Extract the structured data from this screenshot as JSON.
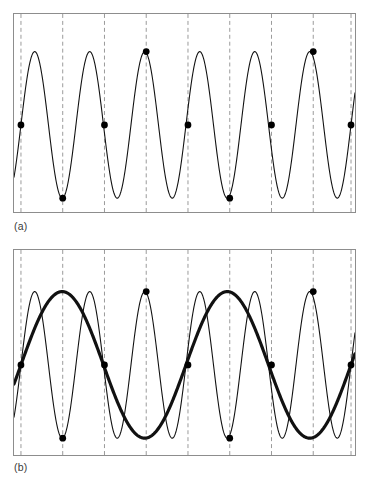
{
  "figure": {
    "background_color": "#ffffff",
    "frame_color": "#8d8d8d",
    "curve_color": "#111111",
    "sample_marker_color": "#000000",
    "dashed_line_color": "#9a9a9a"
  },
  "panels": [
    {
      "id": "a",
      "label": "(a)",
      "caption": "Original high-frequency sine wave with sample points",
      "frame": {
        "x": 13,
        "y": 13,
        "width": 343,
        "height": 200
      },
      "curves": [
        {
          "name": "original-signal",
          "style": "thin",
          "stroke_width": 1.1,
          "cycles": 6.0,
          "phase_deg": 0,
          "amplitude_px": 74,
          "baseline_y_px": 112
        }
      ],
      "sample_lines_x": [
        20,
        62,
        104,
        146,
        188,
        230,
        272,
        314,
        352
      ],
      "sample_points": [
        {
          "x": 20,
          "y": 112,
          "level": "mid-rising"
        },
        {
          "x": 62,
          "y": 186,
          "level": "trough"
        },
        {
          "x": 104,
          "y": 112,
          "level": "mid-rising"
        },
        {
          "x": 146,
          "y": 38,
          "level": "peak"
        },
        {
          "x": 188,
          "y": 112,
          "level": "mid-falling"
        },
        {
          "x": 230,
          "y": 186,
          "level": "trough"
        },
        {
          "x": 272,
          "y": 112,
          "level": "mid-rising"
        },
        {
          "x": 314,
          "y": 38,
          "level": "peak"
        },
        {
          "x": 352,
          "y": 112,
          "level": "mid-falling"
        }
      ]
    },
    {
      "id": "b",
      "label": "(b)",
      "caption": "Same samples reconstructed as a lower-frequency alias wave",
      "frame": {
        "x": 13,
        "y": 249,
        "width": 343,
        "height": 207
      },
      "curves": [
        {
          "name": "original-signal",
          "style": "thin",
          "stroke_width": 1.1,
          "cycles": 6.0,
          "phase_deg": 0,
          "amplitude_px": 74,
          "baseline_y_px": 112
        },
        {
          "name": "alias-signal",
          "style": "thick",
          "stroke_width": 3.2,
          "cycles": 2.0,
          "phase_deg": 0,
          "amplitude_px": 74,
          "baseline_y_px": 112
        }
      ],
      "sample_lines_x": [
        20,
        62,
        104,
        146,
        188,
        230,
        272,
        314,
        352
      ],
      "sample_points": [
        {
          "x": 20,
          "y": 112,
          "level": "mid-falling"
        },
        {
          "x": 62,
          "y": 186,
          "level": "trough"
        },
        {
          "x": 104,
          "y": 112,
          "level": "mid-rising"
        },
        {
          "x": 146,
          "y": 38,
          "level": "peak"
        },
        {
          "x": 188,
          "y": 112,
          "level": "mid-falling"
        },
        {
          "x": 230,
          "y": 186,
          "level": "trough"
        },
        {
          "x": 272,
          "y": 112,
          "level": "mid-rising"
        },
        {
          "x": 314,
          "y": 38,
          "level": "peak"
        },
        {
          "x": 352,
          "y": 112,
          "level": "mid-falling"
        }
      ]
    }
  ],
  "chart_data": {
    "type": "line",
    "xlabel": "",
    "ylabel": "",
    "grid": false,
    "legend": "none",
    "xlim": [
      0,
      1
    ],
    "ylim": [
      -1,
      1
    ],
    "subplots": [
      {
        "label": "(a)",
        "series": [
          {
            "name": "original signal",
            "kind": "sine",
            "frequency_cycles": 6.0,
            "amplitude": 1.0,
            "phase_deg": 0,
            "line_style": "thin solid"
          }
        ],
        "sample_marker_x_normalized": [
          0.0204,
          0.1434,
          0.2664,
          0.3894,
          0.5124,
          0.6354,
          0.7584,
          0.8814,
          0.9927
        ],
        "sample_marker_values": [
          0.0,
          -1.0,
          0.0,
          1.0,
          0.0,
          -1.0,
          0.0,
          1.0,
          0.0
        ]
      },
      {
        "label": "(b)",
        "series": [
          {
            "name": "original signal",
            "kind": "sine",
            "frequency_cycles": 6.0,
            "amplitude": 1.0,
            "phase_deg": 0,
            "line_style": "thin solid"
          },
          {
            "name": "alias signal",
            "kind": "sine",
            "frequency_cycles": 2.0,
            "amplitude": 1.0,
            "phase_deg": 0,
            "line_style": "thick solid"
          }
        ],
        "sample_marker_x_normalized": [
          0.0204,
          0.1434,
          0.2664,
          0.3894,
          0.5124,
          0.6354,
          0.7584,
          0.8814,
          0.9927
        ],
        "sample_marker_values": [
          0.0,
          -1.0,
          0.0,
          1.0,
          0.0,
          -1.0,
          0.0,
          1.0,
          0.0
        ]
      }
    ]
  }
}
